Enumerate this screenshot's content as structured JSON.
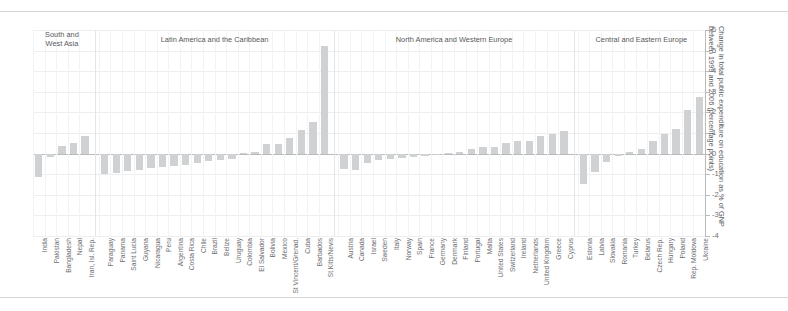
{
  "chart_data": {
    "type": "bar",
    "title": "",
    "xlabel": "",
    "ylabel": "Change in total public expenditure on education as % of GNP\nbetween 1999 and 2006 (percentage points)",
    "ylim": [
      -4,
      6
    ],
    "yticks": [
      6,
      5,
      4,
      3,
      2,
      1,
      0,
      -1,
      -2,
      -3,
      -4
    ],
    "ytick_labels": [
      "6",
      "5",
      "4",
      "3",
      "2",
      "1",
      "0",
      "-1",
      "-2",
      "-3",
      "-4"
    ],
    "grid": true,
    "legend": "none",
    "bar_color": "#cfd1d2",
    "groups": [
      {
        "name": "South and\nWest Asia",
        "categories": [
          "India",
          "Pakistan",
          "Bangladesh",
          "Nepal",
          "Iran, Isl. Rep."
        ],
        "values": [
          -1.15,
          -0.15,
          0.35,
          0.5,
          0.85
        ]
      },
      {
        "name": "Latin America and the Caribbean",
        "categories": [
          "Paraguay",
          "Panama",
          "Saint Lucia",
          "Guyana",
          "Nicaragua",
          "Peru",
          "Argentina",
          "Costa Rica",
          "Chile",
          "Brazil",
          "Belize",
          "Uruguay",
          "Colombia",
          "El Salvador",
          "Bolivia",
          "Mexico",
          "St Vincent/Grenad.",
          "Cuba",
          "Barbados",
          "St Kitts/Nevis"
        ],
        "values": [
          -1.0,
          -0.95,
          -0.85,
          -0.8,
          -0.7,
          -0.65,
          -0.6,
          -0.55,
          -0.45,
          -0.35,
          -0.3,
          -0.25,
          0.05,
          0.1,
          0.45,
          0.45,
          0.75,
          1.15,
          1.55,
          5.2
        ]
      },
      {
        "name": "North America and Western Europe",
        "categories": [
          "Austria",
          "Canada",
          "Israel",
          "Sweden",
          "Italy",
          "Norway",
          "Spain",
          "France",
          "Germany",
          "Denmark",
          "Finland",
          "Portugal",
          "Malta",
          "United States",
          "Switzerland",
          "Ireland",
          "Netherlands",
          "United Kingdom",
          "Greece",
          "Cyprus"
        ],
        "values": [
          -0.75,
          -0.8,
          -0.45,
          -0.3,
          -0.25,
          -0.2,
          -0.15,
          -0.1,
          -0.05,
          0.05,
          0.1,
          0.2,
          0.3,
          0.3,
          0.5,
          0.6,
          0.6,
          0.85,
          0.95,
          1.1
        ]
      },
      {
        "name": "Central and Eastern Europe",
        "categories": [
          "Estonia",
          "Latvia",
          "Slovakia",
          "Romania",
          "Turkey",
          "Belarus",
          "Czech Rep.",
          "Hungary",
          "Poland",
          "Rep. Moldova",
          "Ukraine"
        ],
        "values": [
          -1.5,
          -0.9,
          -0.4,
          -0.1,
          0.1,
          0.2,
          0.6,
          0.95,
          1.2,
          2.1,
          2.75
        ]
      }
    ]
  }
}
